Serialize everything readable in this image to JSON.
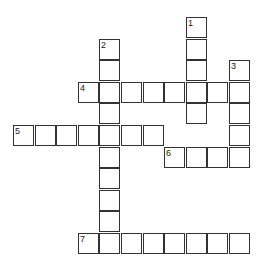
{
  "puzzle": {
    "origin": {
      "x": 13,
      "y": 17
    },
    "step": 21.6,
    "cells": [
      {
        "r": 0,
        "c": 8,
        "num": "1"
      },
      {
        "r": 1,
        "c": 8
      },
      {
        "r": 2,
        "c": 8
      },
      {
        "r": 3,
        "c": 8
      },
      {
        "r": 4,
        "c": 8
      },
      {
        "r": 1,
        "c": 4,
        "num": "2"
      },
      {
        "r": 2,
        "c": 4
      },
      {
        "r": 3,
        "c": 4
      },
      {
        "r": 4,
        "c": 4
      },
      {
        "r": 5,
        "c": 4
      },
      {
        "r": 6,
        "c": 4
      },
      {
        "r": 7,
        "c": 4
      },
      {
        "r": 8,
        "c": 4
      },
      {
        "r": 9,
        "c": 4
      },
      {
        "r": 10,
        "c": 4
      },
      {
        "r": 2,
        "c": 10,
        "num": "3"
      },
      {
        "r": 3,
        "c": 10
      },
      {
        "r": 4,
        "c": 10
      },
      {
        "r": 5,
        "c": 10
      },
      {
        "r": 6,
        "c": 10
      },
      {
        "r": 3,
        "c": 3,
        "num": "4"
      },
      {
        "r": 3,
        "c": 5
      },
      {
        "r": 3,
        "c": 6
      },
      {
        "r": 3,
        "c": 7
      },
      {
        "r": 3,
        "c": 9
      },
      {
        "r": 5,
        "c": 0,
        "num": "5"
      },
      {
        "r": 5,
        "c": 1
      },
      {
        "r": 5,
        "c": 2
      },
      {
        "r": 5,
        "c": 3
      },
      {
        "r": 5,
        "c": 5
      },
      {
        "r": 5,
        "c": 6
      },
      {
        "r": 6,
        "c": 7,
        "num": "6"
      },
      {
        "r": 6,
        "c": 8
      },
      {
        "r": 6,
        "c": 9
      },
      {
        "r": 10,
        "c": 3,
        "num": "7"
      },
      {
        "r": 10,
        "c": 5
      },
      {
        "r": 10,
        "c": 6
      },
      {
        "r": 10,
        "c": 7
      },
      {
        "r": 10,
        "c": 8
      },
      {
        "r": 10,
        "c": 9
      },
      {
        "r": 10,
        "c": 10
      }
    ],
    "words": [
      {
        "num": "1",
        "dir": "down",
        "row": 0,
        "col": 8,
        "length": 5
      },
      {
        "num": "2",
        "dir": "down",
        "row": 1,
        "col": 4,
        "length": 10
      },
      {
        "num": "3",
        "dir": "down",
        "row": 2,
        "col": 10,
        "length": 5
      },
      {
        "num": "4",
        "dir": "across",
        "row": 3,
        "col": 3,
        "length": 8
      },
      {
        "num": "5",
        "dir": "across",
        "row": 5,
        "col": 0,
        "length": 7
      },
      {
        "num": "6",
        "dir": "across",
        "row": 6,
        "col": 7,
        "length": 4
      },
      {
        "num": "7",
        "dir": "across",
        "row": 10,
        "col": 3,
        "length": 8
      }
    ]
  }
}
